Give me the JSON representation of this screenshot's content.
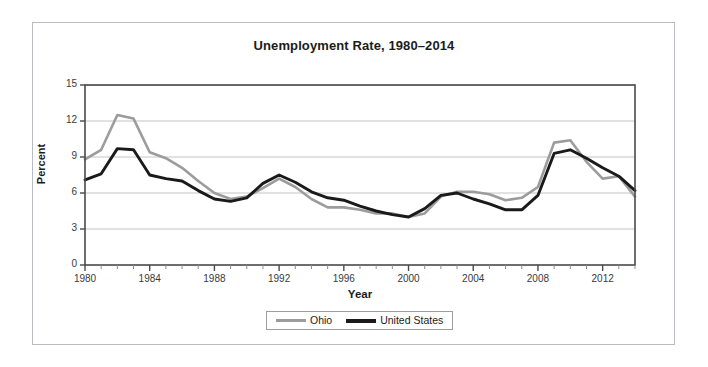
{
  "figure": {
    "title": "Unemployment Rate, 1980–2014",
    "border_color": "#b9bcc0",
    "background": "#ffffff"
  },
  "axes": {
    "x_title": "Year",
    "y_title": "Percent",
    "y_ticks": [
      "0",
      "3",
      "6",
      "9",
      "12",
      "15"
    ],
    "x_ticks": [
      "1980",
      "1984",
      "1988",
      "1992",
      "1996",
      "2000",
      "2004",
      "2008",
      "2012"
    ],
    "frame_color": "#4a4a4a",
    "grid_color": "#c4c4c4"
  },
  "legend": {
    "position": "bottom-center",
    "entries": [
      {
        "label": "Ohio",
        "color": "#9c9c9c"
      },
      {
        "label": "United States",
        "color": "#1a1a1a"
      }
    ]
  },
  "chart_data": {
    "type": "line",
    "title": "Unemployment Rate, 1980–2014",
    "xlabel": "Year",
    "ylabel": "Percent",
    "xlim": [
      1980,
      2014
    ],
    "ylim": [
      0,
      15
    ],
    "yticks": [
      0,
      3,
      6,
      9,
      12,
      15
    ],
    "xticks": [
      1980,
      1984,
      1988,
      1992,
      1996,
      2000,
      2004,
      2008,
      2012
    ],
    "grid": "horizontal",
    "legend_position": "bottom-center",
    "x": [
      1980,
      1981,
      1982,
      1983,
      1984,
      1985,
      1986,
      1987,
      1988,
      1989,
      1990,
      1991,
      1992,
      1993,
      1994,
      1995,
      1996,
      1997,
      1998,
      1999,
      2000,
      2001,
      2002,
      2003,
      2004,
      2005,
      2006,
      2007,
      2008,
      2009,
      2010,
      2011,
      2012,
      2013,
      2014
    ],
    "series": [
      {
        "name": "Ohio",
        "color": "#9c9c9c",
        "values": [
          8.8,
          9.6,
          12.5,
          12.2,
          9.4,
          8.9,
          8.1,
          7.0,
          6.0,
          5.5,
          5.7,
          6.4,
          7.2,
          6.5,
          5.5,
          4.8,
          4.8,
          4.6,
          4.3,
          4.3,
          4.0,
          4.3,
          5.7,
          6.1,
          6.1,
          5.9,
          5.4,
          5.6,
          6.5,
          10.2,
          10.4,
          8.6,
          7.2,
          7.4,
          5.7
        ]
      },
      {
        "name": "United States",
        "color": "#1a1a1a",
        "values": [
          7.1,
          7.6,
          9.7,
          9.6,
          7.5,
          7.2,
          7.0,
          6.2,
          5.5,
          5.3,
          5.6,
          6.8,
          7.5,
          6.9,
          6.1,
          5.6,
          5.4,
          4.9,
          4.5,
          4.2,
          4.0,
          4.7,
          5.8,
          6.0,
          5.5,
          5.1,
          4.6,
          4.6,
          5.8,
          9.3,
          9.6,
          8.9,
          8.1,
          7.4,
          6.2
        ]
      }
    ]
  }
}
